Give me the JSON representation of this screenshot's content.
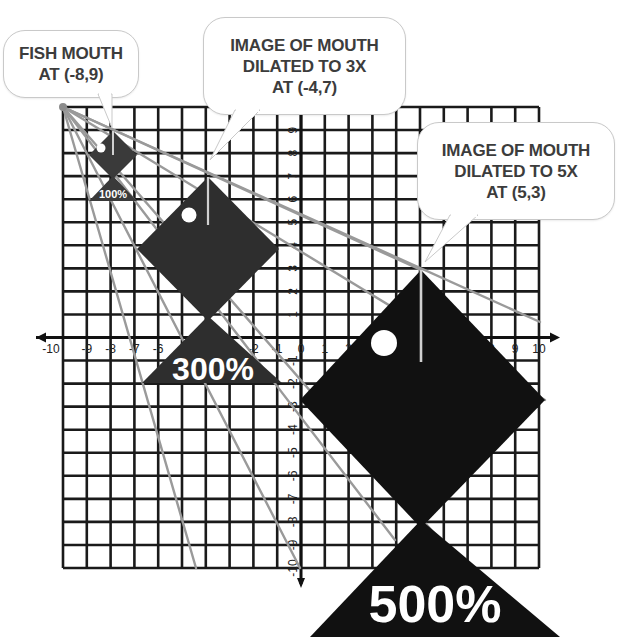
{
  "diagram": {
    "callouts": [
      {
        "id": "original",
        "lines": [
          "FISH MOUTH",
          "AT (-8,9)"
        ]
      },
      {
        "id": "dilated-3x",
        "lines": [
          "IMAGE OF MOUTH",
          "DILATED TO 3X",
          "AT (-4,7)"
        ]
      },
      {
        "id": "dilated-5x",
        "lines": [
          "IMAGE OF MOUTH",
          "DILATED TO 5X",
          "AT (5,3)"
        ]
      }
    ],
    "fish_labels": {
      "small": "100%",
      "medium": "300%",
      "large": "500%"
    },
    "axes": {
      "x_ticks": [
        "-10",
        "-9",
        "-8",
        "-7",
        "-6",
        "-5",
        "-4",
        "-3",
        "-2",
        "-1",
        "0",
        "1",
        "2",
        "3",
        "4",
        "5",
        "6",
        "7",
        "8",
        "9",
        "10"
      ],
      "y_ticks": [
        "10",
        "9",
        "8",
        "7",
        "6",
        "5",
        "4",
        "3",
        "2",
        "1",
        "-1",
        "-2",
        "-3",
        "-4",
        "-5",
        "-6",
        "-7",
        "-8",
        "-9",
        "-10"
      ],
      "xrange": [
        -10,
        10
      ],
      "yrange": [
        -10,
        10
      ]
    },
    "center_of_dilation": [
      -10,
      10
    ],
    "mouth_points": [
      {
        "scale": "1x",
        "point": [
          -8,
          9
        ]
      },
      {
        "scale": "3x",
        "point": [
          -4,
          7
        ]
      },
      {
        "scale": "5x",
        "point": [
          5,
          3
        ]
      }
    ],
    "colors": {
      "fish_small": "#3a3a3a",
      "fish_medium": "#2e2e2e",
      "fish_large": "#111111",
      "grid": "#1a1a1a",
      "rays": "#9a9a9a",
      "callout_text": "#3c3c3c"
    }
  }
}
